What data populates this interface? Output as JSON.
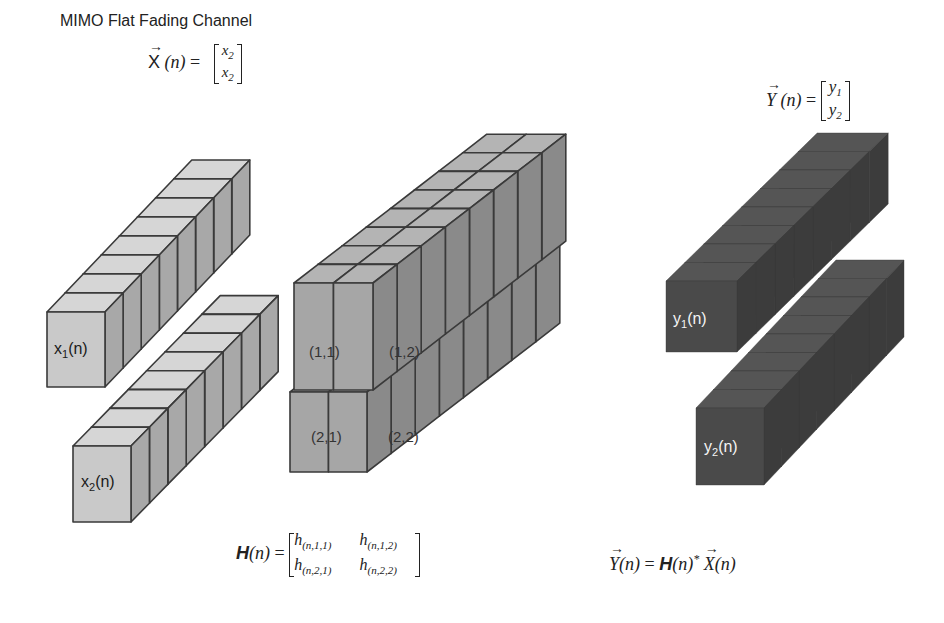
{
  "title": "MIMO Flat Fading Channel",
  "input_vector": {
    "symbol": "X",
    "arg": "(n)",
    "equals": "=",
    "entries": [
      "x",
      "x"
    ],
    "entry_subs": [
      "2",
      "2"
    ]
  },
  "output_vector": {
    "symbol": "Y",
    "arg": "(n)",
    "equals": "=",
    "entries": [
      "y",
      "y"
    ],
    "entry_subs": [
      "1",
      "2"
    ]
  },
  "channel_matrix": {
    "symbol": "H",
    "arg": "(n)",
    "equals": "=",
    "entries": [
      {
        "base": "h",
        "sub": "(n,1,1)"
      },
      {
        "base": "h",
        "sub": "(n,1,2)"
      },
      {
        "base": "h",
        "sub": "(n,2,1)"
      },
      {
        "base": "h",
        "sub": "(n,2,2)"
      }
    ]
  },
  "relation": {
    "lhs_symbol": "Y",
    "lhs_arg": "(n)",
    "equals": "=",
    "h_symbol": "H",
    "h_arg": "(n)",
    "op": "*",
    "rhs_symbol": "X",
    "rhs_arg": "(n)"
  },
  "input_streams": [
    {
      "label": "x",
      "sub": "1",
      "arg": "(n)"
    },
    {
      "label": "x",
      "sub": "2",
      "arg": "(n)"
    }
  ],
  "output_streams": [
    {
      "label": "y",
      "sub": "1",
      "arg": "(n)"
    },
    {
      "label": "y",
      "sub": "2",
      "arg": "(n)"
    }
  ],
  "channel_cells": [
    "(1,1)",
    "(1,2)",
    "(2,1)",
    "(2,2)"
  ],
  "colors": {
    "input_front": "#c9c9c9",
    "input_top": "#d6d6d6",
    "input_side": "#a8a8a8",
    "channel_front": "#a6a6a6",
    "channel_top": "#b4b4b4",
    "channel_side": "#8a8a8a",
    "output_front": "#4a4a4a",
    "output_top": "#555555",
    "output_side": "#3c3c3c",
    "edge": "#3a3a3a"
  },
  "geometry": {
    "cubes_per_stream": 8,
    "x1": {
      "x": 47,
      "y": 312,
      "w": 58,
      "h": 75,
      "dx": 18.1,
      "dy": -19
    },
    "x2": {
      "x": 73,
      "y": 446,
      "w": 58,
      "h": 76,
      "dx": 18.4,
      "dy": -18.8
    },
    "h_top": {
      "x": 294,
      "y": 283,
      "w": 79,
      "h": 107,
      "dx": 24.1,
      "dy": -18.6
    },
    "h_bottom": {
      "x": 290,
      "y": 392,
      "w": 77,
      "h": 80,
      "dx": 24.1,
      "dy": -18.6
    },
    "y1": {
      "x": 666,
      "y": 281,
      "w": 71,
      "h": 71,
      "dx": 18.9,
      "dy": -18.5
    },
    "y2": {
      "x": 696,
      "y": 408,
      "w": 68,
      "h": 77,
      "dx": 17.5,
      "dy": -18.5
    }
  }
}
